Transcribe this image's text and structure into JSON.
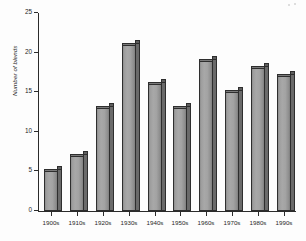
{
  "chart_data": {
    "type": "bar",
    "title": "",
    "subtitle": "",
    "xlabel": "",
    "ylabel": "Number of blends",
    "categories": [
      "1900s",
      "1910s",
      "1920s",
      "1930s",
      "1940s",
      "1950s",
      "1960s",
      "1970s",
      "1980s",
      "1990s"
    ],
    "values": [
      5,
      7,
      13,
      21,
      16,
      13,
      19,
      15,
      18,
      17
    ],
    "ylim": [
      0,
      25
    ],
    "ytick_labels": [
      "0",
      "5",
      "10",
      "15",
      "20",
      "25"
    ],
    "ytick_values": [
      0,
      5,
      10,
      15,
      20,
      25
    ],
    "grid": false,
    "legend": false,
    "legend_position": "none",
    "bar_style": "3d-shaded-gray",
    "colors": {
      "bar_front": "#a3a3a3",
      "bar_side": "#6a6a6a",
      "bar_top": "#5f5f5f",
      "bar_outline": "#2e2e2e",
      "axis": "#2b2b2b",
      "text": "#1f1f1f",
      "background": "#fdfdfd"
    }
  }
}
